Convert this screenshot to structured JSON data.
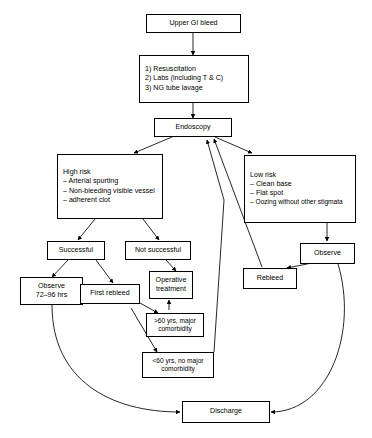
{
  "diagram": {
    "type": "flowchart",
    "stroke_color": "#000000",
    "background_color": "#ffffff"
  },
  "nodes": {
    "upper_gi_bleed": {
      "label": "Upper GI bleed"
    },
    "initial_management": {
      "line1": "1) Resuscitation",
      "line2": "2) Labs (including T & C)",
      "line3": "3) NG tube lavage"
    },
    "endoscopy": {
      "label": "Endoscopy"
    },
    "high_risk": {
      "heading": "High risk",
      "item1": "– Arterial spurting",
      "item2": "– Non-bleeding visible vessel",
      "item3": "– adherent clot"
    },
    "low_risk": {
      "heading": "Low risk",
      "item1": "– Clean base",
      "item2": "– Flat spot",
      "item3": "– Oozing without other stigmata"
    },
    "successful": {
      "label": "Successful"
    },
    "not_successful": {
      "label": "Not successful"
    },
    "observe_72_96": {
      "line1": "Observe",
      "line2": "72–96 hrs"
    },
    "first_rebleed": {
      "label": "First rebleed"
    },
    "operative_treatment": {
      "line1": "Operative",
      "line2": "treatment"
    },
    "over_60": {
      "line1": ">60 yrs, major",
      "line2": "comorbidity"
    },
    "under_60": {
      "line1": "<60 yrs, no major",
      "line2": "comorbidity"
    },
    "rebleed": {
      "label": "Rebleed"
    },
    "observe": {
      "label": "Observe"
    },
    "discharge": {
      "label": "Discharge"
    }
  },
  "edges": [
    {
      "from": "upper_gi_bleed",
      "to": "initial_management"
    },
    {
      "from": "initial_management",
      "to": "endoscopy"
    },
    {
      "from": "endoscopy",
      "to": "high_risk"
    },
    {
      "from": "endoscopy",
      "to": "low_risk"
    },
    {
      "from": "high_risk",
      "to": "successful"
    },
    {
      "from": "high_risk",
      "to": "not_successful"
    },
    {
      "from": "successful",
      "to": "observe_72_96"
    },
    {
      "from": "successful",
      "to": "first_rebleed"
    },
    {
      "from": "not_successful",
      "to": "operative_treatment"
    },
    {
      "from": "first_rebleed",
      "to": "over_60"
    },
    {
      "from": "first_rebleed",
      "to": "under_60"
    },
    {
      "from": "over_60",
      "to": "operative_treatment"
    },
    {
      "from": "under_60",
      "to": "endoscopy"
    },
    {
      "from": "low_risk",
      "to": "observe"
    },
    {
      "from": "observe",
      "to": "rebleed"
    },
    {
      "from": "rebleed",
      "to": "endoscopy"
    },
    {
      "from": "observe_72_96",
      "to": "discharge"
    },
    {
      "from": "observe",
      "to": "discharge"
    }
  ]
}
